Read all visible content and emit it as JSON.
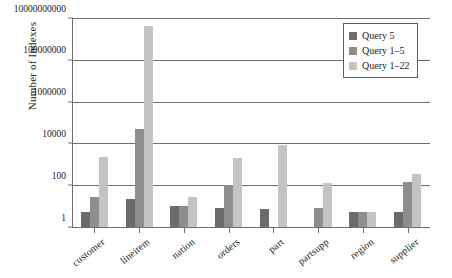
{
  "chart_data": {
    "type": "bar",
    "title": "",
    "xlabel": "",
    "ylabel": "Number of Indexes",
    "yscale": "log",
    "ylim": [
      1,
      10000000000
    ],
    "yticks": [
      1,
      100,
      10000,
      1000000,
      100000000,
      10000000000
    ],
    "ytick_labels": [
      "1",
      "100",
      "10000",
      "1000000",
      "100000000",
      "10000000000"
    ],
    "grid": true,
    "legend_position": "top-right",
    "categories": [
      "customer",
      "lineitem",
      "nation",
      "orders",
      "part",
      "partsupp",
      "region",
      "supplier"
    ],
    "series": [
      {
        "name": "Query 5",
        "color": "#6b6b6b",
        "values": [
          5,
          22,
          10,
          8,
          7,
          0,
          5,
          5
        ]
      },
      {
        "name": "Query 1–5",
        "color": "#8e8e8e",
        "values": [
          28,
          50000,
          10,
          100,
          0,
          8,
          5,
          150
        ]
      },
      {
        "name": "Query 1–22",
        "color": "#c4c4c4",
        "values": [
          2300,
          4000000000,
          28,
          2000,
          8000,
          130,
          5,
          350
        ]
      }
    ]
  },
  "legend": {
    "items": [
      {
        "label": "Query 5"
      },
      {
        "label": "Query 1–5"
      },
      {
        "label": "Query 1–22"
      }
    ]
  }
}
